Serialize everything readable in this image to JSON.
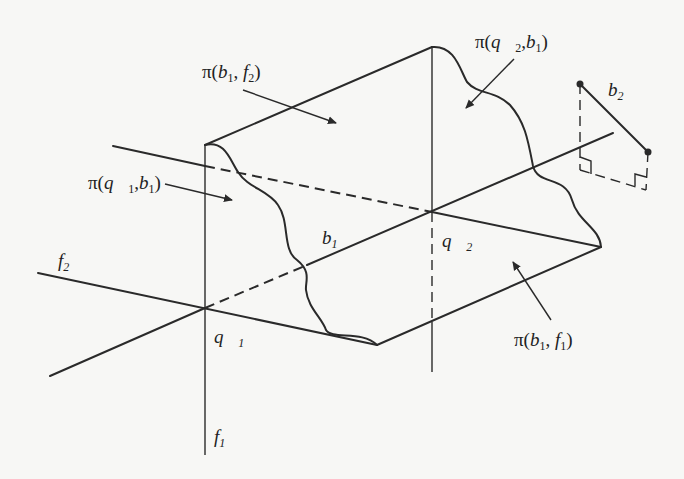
{
  "figure": {
    "colors": {
      "background": "#f7f7f5",
      "ink": "#2a2a2a"
    },
    "labels": {
      "pi_b1_f2": {
        "prefix": "π(",
        "a": "b",
        "a_sub": "1",
        "sep": ", ",
        "b": "f",
        "b_sub": "2",
        "suffix": ")"
      },
      "pi_q2_b1": {
        "prefix": "π(",
        "a": "q⃗",
        "a_sub": "2",
        "sep": ",",
        "b": "b",
        "b_sub": "1",
        "suffix": ")"
      },
      "pi_q1_b1": {
        "prefix": "π(",
        "a": "q⃗",
        "a_sub": "1",
        "sep": ",",
        "b": "b",
        "b_sub": "1",
        "suffix": ")"
      },
      "pi_b1_f1": {
        "prefix": "π(",
        "a": "b",
        "a_sub": "1",
        "sep": ", ",
        "b": "f",
        "b_sub": "1",
        "suffix": ")"
      },
      "b1": {
        "sym": "b",
        "sub": "1"
      },
      "b2": {
        "sym": "b",
        "sub": "2"
      },
      "f1": {
        "sym": "f",
        "sub": "1"
      },
      "f2": {
        "sym": "f",
        "sub": "2"
      },
      "q1": {
        "sym": "q⃗",
        "sub": "1"
      },
      "q2": {
        "sym": "q⃗",
        "sub": "2"
      }
    },
    "points": {
      "q1": [
        205,
        308
      ],
      "q2": [
        432,
        212
      ],
      "top_left_vertex": [
        205,
        145
      ],
      "top_vertex": [
        432,
        47
      ],
      "right_apex": [
        601,
        247
      ],
      "bottom_apex": [
        377,
        345
      ],
      "b2_end_a": [
        580,
        84
      ],
      "b2_end_b": [
        648,
        152
      ]
    }
  }
}
